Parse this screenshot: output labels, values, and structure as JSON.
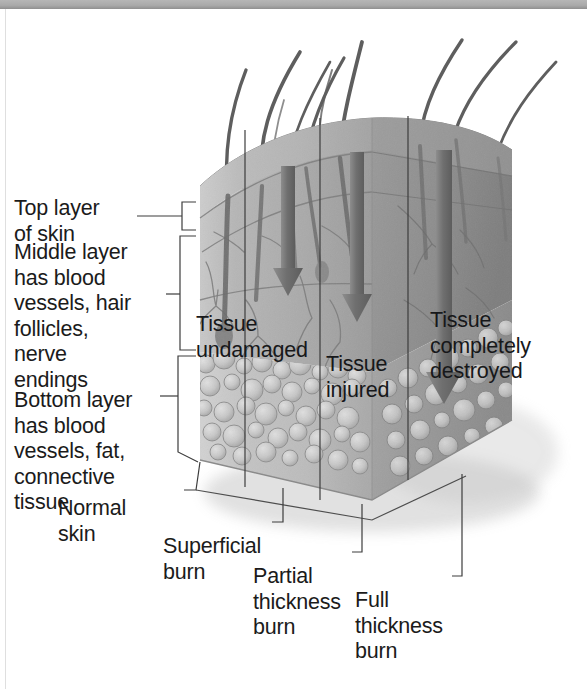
{
  "figure": {
    "title": "Cross-section of skin showing burn depth",
    "width": 587,
    "height": 689
  },
  "colors": {
    "top_bar": "#a9a9a9",
    "left_rule": "#dfdfdf",
    "label_text": "#1b1b1b",
    "leader_line": "#4a4a4a",
    "epidermis": "#b9b9b9",
    "dermis": "#b0b0b0",
    "hypodermis": "#c2c2c2",
    "hair": "#5c5c5c",
    "arrow": "#7b7b7b",
    "background": "#ffffff"
  },
  "left_labels": [
    {
      "id": "top-layer",
      "text": "Top layer\nof skin",
      "x": 14,
      "y": 196
    },
    {
      "id": "middle-layer",
      "text": "Middle layer\nhas blood\nvessels, hair\nfollicles,\nnerve\nendings",
      "x": 14,
      "y": 240
    },
    {
      "id": "bottom-layer",
      "text": "Bottom layer\nhas blood\nvessels, fat,\nconnective\ntissue",
      "x": 14,
      "y": 388
    }
  ],
  "on_art_labels": [
    {
      "id": "tissue-undamaged",
      "text": "Tissue\nundamaged",
      "x": 196,
      "y": 312
    },
    {
      "id": "tissue-injured",
      "text": "Tissue\ninjured",
      "x": 326,
      "y": 352
    },
    {
      "id": "tissue-completely-destroyed",
      "text": "Tissue\ncompletely\ndestroyed",
      "x": 430,
      "y": 308
    }
  ],
  "bottom_labels": [
    {
      "id": "normal-skin",
      "text": "Normal\nskin",
      "x": 132,
      "y": 496
    },
    {
      "id": "superficial-burn",
      "text": "Superficial\nburn",
      "x": 233,
      "y": 534
    },
    {
      "id": "partial-thickness-burn",
      "text": "Partial\nthickness\nburn",
      "x": 331,
      "y": 564
    },
    {
      "id": "full-thickness-burn",
      "text": "Full\nthickness\nburn",
      "x": 437,
      "y": 588
    }
  ],
  "burn_zones": [
    {
      "name": "Normal skin",
      "depth": "none"
    },
    {
      "name": "Superficial burn",
      "depth": "top layer only"
    },
    {
      "name": "Partial thickness burn",
      "depth": "top and middle layers"
    },
    {
      "name": "Full thickness burn",
      "depth": "all layers"
    }
  ],
  "skin_layers": [
    {
      "name": "Top layer of skin"
    },
    {
      "name": "Middle layer has blood vessels, hair follicles, nerve endings"
    },
    {
      "name": "Bottom layer has blood vessels, fat, connective tissue"
    }
  ]
}
